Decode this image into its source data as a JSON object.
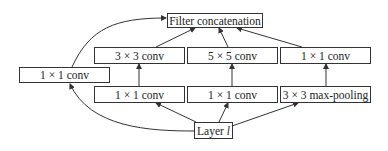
{
  "diagram": {
    "colors": {
      "stroke": "#333333",
      "text": "#222222",
      "background": "#ffffff"
    },
    "nodes": {
      "concat": {
        "label": "Filter concatenation"
      },
      "conv3x3": {
        "label": "3 × 3 conv"
      },
      "conv5x5": {
        "label": "5 × 5 conv"
      },
      "conv1x1_pool": {
        "label": "1 × 1 conv"
      },
      "conv1x1_left": {
        "label": "1 × 1 conv"
      },
      "conv1x1_a": {
        "label": "1 × 1 conv"
      },
      "conv1x1_b": {
        "label": "1 × 1 conv"
      },
      "maxpool": {
        "label": "3 × 3 max-pooling"
      },
      "layer": {
        "label_prefix": "Layer ",
        "label_var": "l"
      }
    },
    "edges": [
      {
        "from": "layer",
        "to": "conv1x1_left"
      },
      {
        "from": "layer",
        "to": "conv1x1_a"
      },
      {
        "from": "layer",
        "to": "conv1x1_b"
      },
      {
        "from": "layer",
        "to": "maxpool"
      },
      {
        "from": "conv1x1_a",
        "to": "conv3x3"
      },
      {
        "from": "conv1x1_b",
        "to": "conv5x5"
      },
      {
        "from": "maxpool",
        "to": "conv1x1_pool"
      },
      {
        "from": "conv1x1_left",
        "to": "concat"
      },
      {
        "from": "conv3x3",
        "to": "concat"
      },
      {
        "from": "conv5x5",
        "to": "concat"
      },
      {
        "from": "conv1x1_pool",
        "to": "concat"
      }
    ]
  }
}
